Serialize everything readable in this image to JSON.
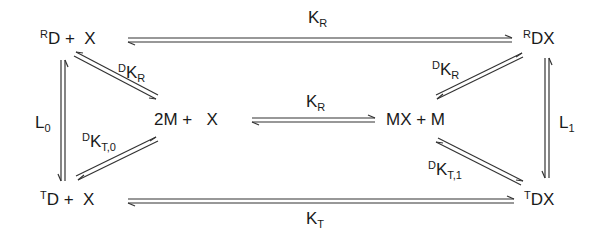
{
  "species": {
    "RD_X": {
      "pre": "R",
      "main": "D",
      "tail": " +  X"
    },
    "RDX": {
      "pre": "R",
      "main": "DX",
      "tail": ""
    },
    "TD_X": {
      "pre": "T",
      "main": "D",
      "tail": " +  X"
    },
    "TDX": {
      "pre": "T",
      "main": "DX",
      "tail": ""
    },
    "M2_X": {
      "pre": "",
      "main": "2M +",
      "tail": "   X"
    },
    "MX_M": {
      "pre": "",
      "main": "MX + M",
      "tail": ""
    }
  },
  "constants": {
    "top": {
      "pre": "",
      "main": "K",
      "sub": "R"
    },
    "bottom": {
      "pre": "",
      "main": "K",
      "sub": "T"
    },
    "middle": {
      "pre": "",
      "main": "K",
      "sub": "R"
    },
    "left_vert": {
      "pre": "",
      "main": "L",
      "sub": "0"
    },
    "right_vert": {
      "pre": "",
      "main": "L",
      "sub": "1"
    },
    "diag_ul": {
      "pre": "D",
      "main": "K",
      "sub": "R"
    },
    "diag_ur": {
      "pre": "D",
      "main": "K",
      "sub": "R"
    },
    "diag_ll": {
      "pre": "D",
      "main": "K",
      "sub": "T,0"
    },
    "diag_lr": {
      "pre": "D",
      "main": "K",
      "sub": "T,1"
    }
  }
}
